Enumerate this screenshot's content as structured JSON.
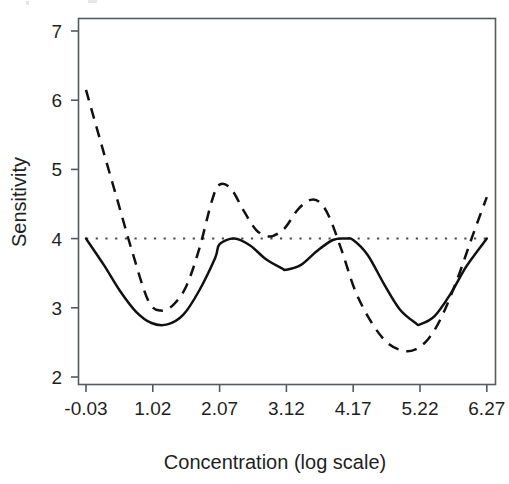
{
  "figure": {
    "background_color": "#ffffff",
    "foreground_color": "#111111"
  },
  "axes": {
    "y_title": "Sensitivity",
    "x_title": "Concentration (log scale)",
    "y_ticks": [
      "7",
      "6",
      "5",
      "4",
      "3",
      "2"
    ],
    "x_ticks": [
      "-0.03",
      "1.02",
      "2.07",
      "3.12",
      "4.17",
      "5.22",
      "6.27"
    ]
  },
  "chart_data": {
    "type": "line",
    "title": "",
    "xlabel": "Concentration (log scale)",
    "ylabel": "Sensitivity",
    "xlim": [
      -0.03,
      6.27
    ],
    "ylim": [
      2,
      7
    ],
    "xticks": [
      -0.03,
      1.02,
      2.07,
      3.12,
      4.17,
      5.22,
      6.27
    ],
    "yticks": [
      2,
      3,
      4,
      5,
      6,
      7
    ],
    "grid": false,
    "legend": "none",
    "series": [
      {
        "name": "solid-curve",
        "style": "solid",
        "color": "#111111",
        "x": [
          -0.03,
          0.25,
          0.5,
          0.75,
          1.0,
          1.25,
          1.5,
          1.75,
          2.0,
          2.07,
          2.3,
          2.55,
          2.8,
          3.05,
          3.12,
          3.35,
          3.6,
          3.85,
          4.05,
          4.17,
          4.4,
          4.65,
          4.9,
          5.15,
          5.22,
          5.45,
          5.7,
          5.95,
          6.27
        ],
        "y": [
          4.0,
          3.62,
          3.25,
          2.95,
          2.78,
          2.76,
          2.9,
          3.25,
          3.72,
          3.92,
          4.0,
          3.9,
          3.7,
          3.57,
          3.55,
          3.62,
          3.82,
          3.98,
          4.0,
          3.98,
          3.76,
          3.35,
          2.98,
          2.78,
          2.76,
          2.88,
          3.2,
          3.6,
          4.0
        ]
      },
      {
        "name": "dashed-curve",
        "style": "dashed",
        "color": "#111111",
        "x": [
          -0.03,
          0.2,
          0.45,
          0.7,
          0.95,
          1.15,
          1.35,
          1.55,
          1.75,
          1.95,
          2.07,
          2.25,
          2.45,
          2.65,
          2.85,
          3.0,
          3.12,
          3.3,
          3.5,
          3.65,
          3.8,
          4.0,
          4.2,
          4.45,
          4.7,
          4.95,
          5.15,
          5.35,
          5.55,
          5.8,
          6.05,
          6.27
        ],
        "y": [
          6.15,
          5.4,
          4.6,
          3.8,
          3.1,
          2.96,
          3.05,
          3.32,
          3.85,
          4.55,
          4.78,
          4.72,
          4.4,
          4.12,
          4.03,
          4.08,
          4.18,
          4.42,
          4.56,
          4.52,
          4.3,
          3.8,
          3.25,
          2.8,
          2.5,
          2.38,
          2.4,
          2.55,
          2.85,
          3.4,
          4.05,
          4.6
        ]
      },
      {
        "name": "reference-line",
        "style": "dotted",
        "color": "#4a4a4a",
        "x": [
          -0.03,
          6.27
        ],
        "y": [
          4.0,
          4.0
        ]
      }
    ]
  }
}
